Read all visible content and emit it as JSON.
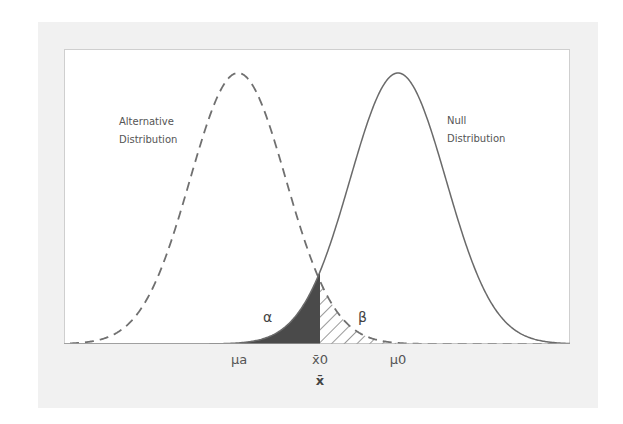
{
  "diagram": {
    "type": "hypothesis-test-distributions",
    "labels": {
      "alternative_line1": "Alternative",
      "alternative_line2": "Distribution",
      "null_line1": "Null",
      "null_line2": "Distribution",
      "alpha": "α",
      "beta": "β"
    },
    "x_ticks": [
      {
        "label": "μa",
        "x": 239
      },
      {
        "label": "x̄0",
        "x": 320
      },
      {
        "label": "μ0",
        "x": 398
      }
    ],
    "x_axis_label": "x̄",
    "curves": {
      "alternative": {
        "mean_px": 238,
        "sigma_px": 48,
        "style": "dashed"
      },
      "null": {
        "mean_px": 398,
        "sigma_px": 48,
        "style": "solid"
      }
    },
    "critical_value_px": 320,
    "colors": {
      "curve": "#6e6e6e",
      "alpha_fill": "#4a4a4a",
      "beta_hatch": "#555555",
      "panel_bg": "#f1f1f1",
      "plot_bg": "#ffffff"
    }
  }
}
